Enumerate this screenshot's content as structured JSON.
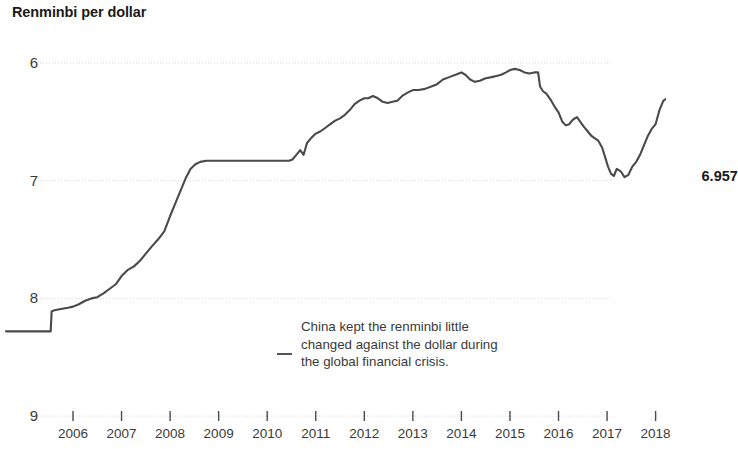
{
  "chart": {
    "title": "Renminbi per dollar",
    "annotation": "China kept the renminbi little changed against the dollar during the global financial crisis.",
    "end_label": "6.957",
    "dash_marker": "annotation-leader-dash"
  },
  "chart_data": {
    "type": "line",
    "title": "Renminbi per dollar",
    "xlabel": "",
    "ylabel": "Renminbi per dollar",
    "xlim": [
      2004.6,
      2018.85
    ],
    "ylim": [
      9,
      6
    ],
    "y_inverted": true,
    "grid": true,
    "gridlines_y": [
      6,
      7,
      8,
      9
    ],
    "legend": "none",
    "line_color": "#4a4a4a",
    "end_point": {
      "x": 2018.72,
      "y": 6.957,
      "label": "6.957",
      "marker": "filled-circle"
    },
    "annotations": [
      {
        "text": "China kept the renminbi little changed against the dollar during the global financial crisis.",
        "x": 2010.3,
        "y": 8.45
      }
    ],
    "yticks": [
      6,
      7,
      8,
      9
    ],
    "ytick_labels": [
      "6",
      "7",
      "8",
      "9"
    ],
    "xticks": [
      2006,
      2007,
      2008,
      2009,
      2010,
      2011,
      2012,
      2013,
      2014,
      2015,
      2016,
      2017,
      2018
    ],
    "xtick_labels": [
      "2006",
      "2007",
      "2008",
      "2009",
      "2010",
      "2011",
      "2012",
      "2013",
      "2014",
      "2015",
      "2016",
      "2017",
      "2018"
    ],
    "series": [
      {
        "name": "Renminbi per dollar",
        "x": [
          2004.62,
          2004.8,
          2005.0,
          2005.2,
          2005.4,
          2005.54,
          2005.56,
          2005.62,
          2005.75,
          2005.9,
          2006.0,
          2006.12,
          2006.25,
          2006.38,
          2006.5,
          2006.62,
          2006.75,
          2006.88,
          2007.0,
          2007.12,
          2007.25,
          2007.38,
          2007.5,
          2007.62,
          2007.75,
          2007.88,
          2008.0,
          2008.12,
          2008.22,
          2008.32,
          2008.42,
          2008.52,
          2008.62,
          2008.75,
          2008.88,
          2009.0,
          2009.25,
          2009.5,
          2009.75,
          2010.0,
          2010.25,
          2010.45,
          2010.52,
          2010.6,
          2010.68,
          2010.75,
          2010.82,
          2010.9,
          2011.0,
          2011.1,
          2011.2,
          2011.3,
          2011.4,
          2011.5,
          2011.6,
          2011.7,
          2011.8,
          2011.9,
          2012.0,
          2012.08,
          2012.18,
          2012.28,
          2012.38,
          2012.48,
          2012.58,
          2012.68,
          2012.78,
          2012.9,
          2013.0,
          2013.12,
          2013.25,
          2013.38,
          2013.5,
          2013.62,
          2013.75,
          2013.88,
          2014.0,
          2014.08,
          2014.18,
          2014.28,
          2014.38,
          2014.5,
          2014.62,
          2014.72,
          2014.82,
          2014.92,
          2015.0,
          2015.1,
          2015.2,
          2015.3,
          2015.4,
          2015.5,
          2015.58,
          2015.62,
          2015.68,
          2015.75,
          2015.85,
          2015.92,
          2016.0,
          2016.08,
          2016.15,
          2016.22,
          2016.3,
          2016.38,
          2016.45,
          2016.52,
          2016.6,
          2016.68,
          2016.75,
          2016.82,
          2016.9,
          2016.96,
          2017.02,
          2017.08,
          2017.14,
          2017.2,
          2017.28,
          2017.36,
          2017.44,
          2017.52,
          2017.6,
          2017.68,
          2017.76,
          2017.84,
          2017.92,
          2018.0,
          2018.08,
          2018.16,
          2018.24,
          2018.32,
          2018.4,
          2018.48,
          2018.56,
          2018.64,
          2018.72
        ],
        "y": [
          8.28,
          8.28,
          8.28,
          8.28,
          8.28,
          8.28,
          8.11,
          8.1,
          8.09,
          8.08,
          8.07,
          8.05,
          8.02,
          8.0,
          7.99,
          7.96,
          7.92,
          7.88,
          7.81,
          7.76,
          7.73,
          7.68,
          7.62,
          7.56,
          7.5,
          7.43,
          7.3,
          7.18,
          7.08,
          6.98,
          6.9,
          6.86,
          6.84,
          6.83,
          6.83,
          6.83,
          6.83,
          6.83,
          6.83,
          6.83,
          6.83,
          6.83,
          6.82,
          6.78,
          6.74,
          6.78,
          6.68,
          6.64,
          6.6,
          6.58,
          6.55,
          6.52,
          6.49,
          6.47,
          6.44,
          6.4,
          6.35,
          6.32,
          6.3,
          6.3,
          6.28,
          6.3,
          6.33,
          6.34,
          6.33,
          6.32,
          6.28,
          6.25,
          6.23,
          6.23,
          6.22,
          6.2,
          6.18,
          6.14,
          6.12,
          6.1,
          6.08,
          6.1,
          6.14,
          6.16,
          6.15,
          6.13,
          6.12,
          6.11,
          6.1,
          6.08,
          6.06,
          6.05,
          6.06,
          6.08,
          6.09,
          6.08,
          6.08,
          6.2,
          6.24,
          6.26,
          6.32,
          6.37,
          6.42,
          6.5,
          6.53,
          6.52,
          6.48,
          6.46,
          6.5,
          6.54,
          6.58,
          6.62,
          6.64,
          6.66,
          6.72,
          6.8,
          6.88,
          6.94,
          6.96,
          6.9,
          6.92,
          6.97,
          6.95,
          6.88,
          6.84,
          6.78,
          6.7,
          6.62,
          6.56,
          6.52,
          6.4,
          6.32,
          6.3,
          6.34,
          6.45,
          6.62,
          6.8,
          6.9,
          6.957
        ]
      }
    ]
  }
}
